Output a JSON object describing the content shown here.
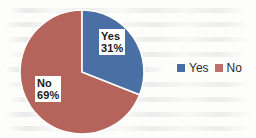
{
  "chart_data": {
    "type": "pie",
    "title": "",
    "subtitle": "",
    "xlabel": "",
    "ylabel": "",
    "categories": [
      "Yes",
      "No"
    ],
    "values": [
      31,
      69
    ],
    "value_unit": "%",
    "slices": [
      {
        "label": "Yes",
        "value": 31,
        "value_text": "31%",
        "color": "#4a6fa5",
        "start_angle_deg": 0,
        "sweep_deg": 111.6
      },
      {
        "label": "No",
        "value": 69,
        "value_text": "69%",
        "color": "#b5645c",
        "start_angle_deg": 111.6,
        "sweep_deg": 248.4
      }
    ],
    "data_labels": [
      {
        "name": "Yes",
        "value_text": "31%"
      },
      {
        "name": "No",
        "value_text": "69%"
      }
    ],
    "legend": {
      "position": "right",
      "orientation": "horizontal",
      "entries": [
        {
          "label": "Yes",
          "color": "#4a6fa5"
        },
        {
          "label": "No",
          "color": "#c0706a"
        }
      ]
    },
    "grid": false,
    "start_angle_note": "first slice begins at 12 o'clock, drawn clockwise",
    "colors": {
      "yes": "#4a6fa5",
      "no": "#b5645c",
      "separator": "#ffffff",
      "background": "#fdfdfc",
      "label_text": "#1a1a1a",
      "label_background": "#ffffff"
    }
  }
}
